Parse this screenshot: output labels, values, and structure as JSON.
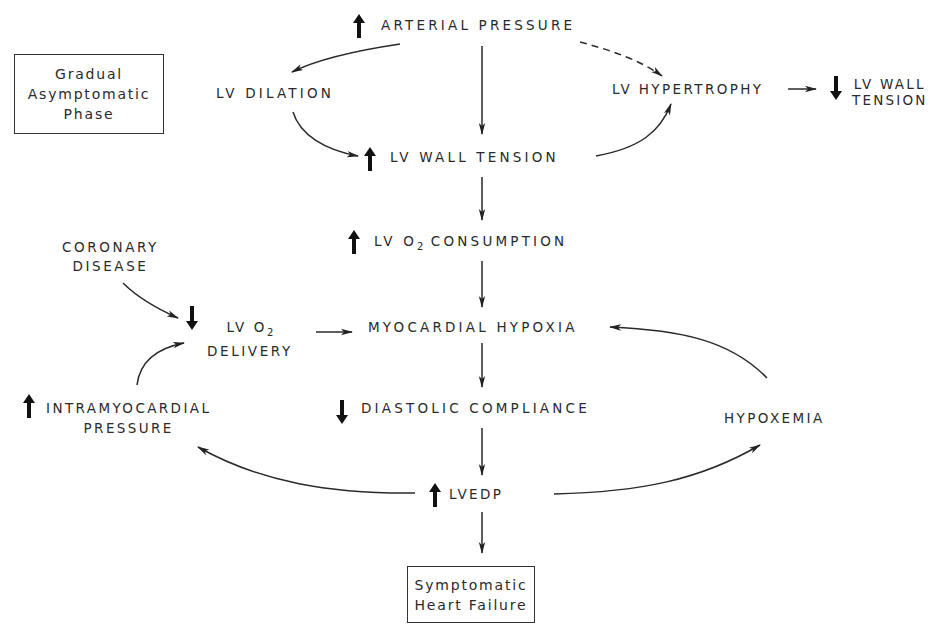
{
  "diagram": {
    "boxes": {
      "gradual": [
        "Gradual",
        "Asymptomatic",
        "Phase"
      ],
      "symptomatic": [
        "Symptomatic",
        "Heart Failure"
      ]
    },
    "nodes": {
      "arterial_pressure": {
        "text": "ARTERIAL PRESSURE",
        "indicator": "increase"
      },
      "lv_dilation": {
        "text": "LV DILATION"
      },
      "lv_hypertrophy": {
        "text": "LV HYPERTROPHY"
      },
      "lv_wall_tension_dec": {
        "line1": "LV WALL",
        "line2": "TENSION",
        "indicator": "decrease"
      },
      "lv_wall_tension_inc": {
        "text": "LV WALL TENSION",
        "indicator": "increase"
      },
      "lv_o2_consumption": {
        "pre": "LV O",
        "sub": "2",
        "post": " CONSUMPTION",
        "indicator": "increase"
      },
      "coronary_disease": {
        "line1": "CORONARY",
        "line2": "DISEASE"
      },
      "lv_o2_delivery": {
        "pre": "LV O",
        "sub": "2",
        "line2": "DELIVERY",
        "indicator": "decrease"
      },
      "myocardial_hypoxia": {
        "text": "MYOCARDIAL HYPOXIA"
      },
      "intramyocardial_pressure": {
        "line1": "INTRAMYOCARDIAL",
        "line2": "PRESSURE",
        "indicator": "increase"
      },
      "diastolic_compliance": {
        "text": "DIASTOLIC COMPLIANCE",
        "indicator": "decrease"
      },
      "hypoxemia": {
        "text": "HYPOXEMIA"
      },
      "lvedp": {
        "text": "LVEDP",
        "indicator": "increase"
      }
    },
    "edges": [
      {
        "from": "arterial_pressure",
        "to": "lv_dilation",
        "style": "solid"
      },
      {
        "from": "arterial_pressure",
        "to": "lv_wall_tension_inc",
        "style": "solid"
      },
      {
        "from": "arterial_pressure",
        "to": "lv_hypertrophy",
        "style": "dashed"
      },
      {
        "from": "lv_dilation",
        "to": "lv_wall_tension_inc",
        "style": "solid"
      },
      {
        "from": "lv_wall_tension_inc",
        "to": "lv_hypertrophy",
        "style": "solid"
      },
      {
        "from": "lv_hypertrophy",
        "to": "lv_wall_tension_dec",
        "style": "solid"
      },
      {
        "from": "lv_wall_tension_inc",
        "to": "lv_o2_consumption",
        "style": "solid"
      },
      {
        "from": "lv_o2_consumption",
        "to": "myocardial_hypoxia",
        "style": "solid"
      },
      {
        "from": "coronary_disease",
        "to": "lv_o2_delivery",
        "style": "solid"
      },
      {
        "from": "intramyocardial_pressure",
        "to": "lv_o2_delivery",
        "style": "solid"
      },
      {
        "from": "lv_o2_delivery",
        "to": "myocardial_hypoxia",
        "style": "solid"
      },
      {
        "from": "hypoxemia",
        "to": "myocardial_hypoxia",
        "style": "solid"
      },
      {
        "from": "myocardial_hypoxia",
        "to": "diastolic_compliance",
        "style": "solid"
      },
      {
        "from": "diastolic_compliance",
        "to": "lvedp",
        "style": "solid"
      },
      {
        "from": "lvedp",
        "to": "intramyocardial_pressure",
        "style": "solid"
      },
      {
        "from": "lvedp",
        "to": "hypoxemia",
        "style": "solid"
      },
      {
        "from": "lvedp",
        "to": "symptomatic",
        "style": "solid"
      }
    ]
  }
}
